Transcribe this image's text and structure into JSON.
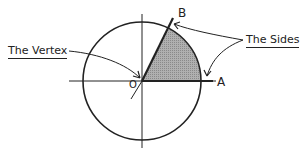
{
  "diagram": {
    "vertex_label": "The Vertex",
    "sides_label": "The Sides",
    "point_a": "A",
    "point_b": "B",
    "origin_mark": "O",
    "colors": {
      "stroke": "#222222",
      "shade": "#9a9a9a",
      "background": "#ffffff"
    }
  }
}
